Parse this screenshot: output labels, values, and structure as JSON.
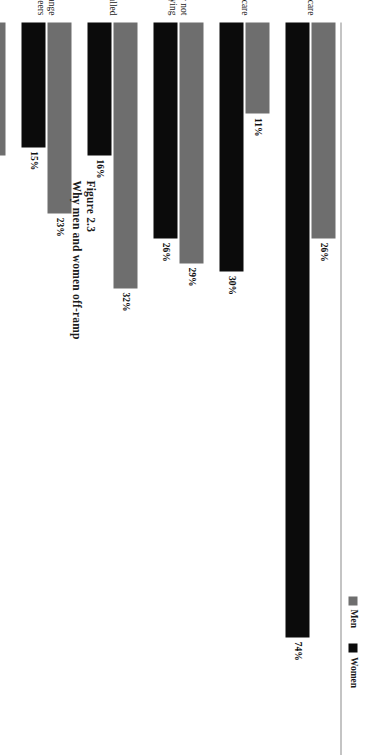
{
  "figure": {
    "number": "Figure 2.3",
    "title": "Why men and women off-ramp"
  },
  "legend": {
    "position": "right",
    "entries": [
      {
        "label": "Men",
        "color": "#6e6e6e",
        "swatch": "men-swatch"
      },
      {
        "label": "Women",
        "color": "#0b0b0b",
        "swatch": "women-swatch"
      }
    ]
  },
  "chart_data": {
    "type": "bar",
    "orientation": "horizontal",
    "title": "Why men and women off-ramp",
    "subtitle": "Figure 2.3",
    "xlabel": "",
    "ylabel": "",
    "xlim": [
      0,
      80
    ],
    "grid": false,
    "legend_position": "right",
    "value_suffix": "%",
    "categories": [
      "Childcare",
      "Eldercare",
      "Career not satisfying",
      "Stalled",
      "Change careers",
      "No longer interested in career",
      "Work too demanding",
      "Compensation",
      "Start own business"
    ],
    "category_lines": [
      [
        "Childcare"
      ],
      [
        "Eldercare"
      ],
      [
        "Career not",
        "satisfying"
      ],
      [
        "Stalled"
      ],
      [
        "Change",
        "careers"
      ],
      [
        "No longer",
        "interested",
        "in career"
      ],
      [
        "Work too",
        "demanding"
      ],
      [
        "Compensation"
      ],
      [
        "Start own",
        "business"
      ]
    ],
    "series": [
      {
        "name": "Men",
        "color": "#6e6e6e",
        "values": [
          26,
          11,
          29,
          32,
          23,
          16,
          3,
          13,
          11
        ],
        "labels": [
          "26%",
          "11%",
          "29%",
          "32%",
          "23%",
          "16%",
          "3%",
          "13%",
          "11%"
        ]
      },
      {
        "name": "Women",
        "color": "#0b0b0b",
        "values": [
          74,
          30,
          26,
          16,
          15,
          11,
          6,
          5,
          4
        ],
        "labels": [
          "74%",
          "30%",
          "26%",
          "16%",
          "15%",
          "11%",
          "6%",
          "5%",
          "4%"
        ]
      }
    ]
  }
}
